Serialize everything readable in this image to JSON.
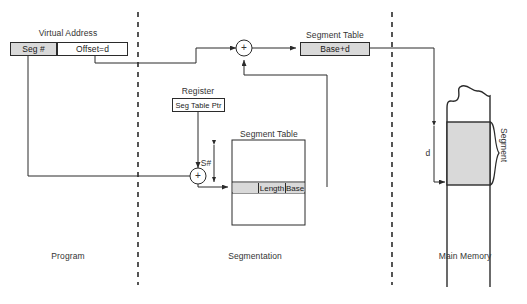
{
  "diagram": {
    "colors": {
      "line": "#2b2b2b",
      "shade": "#d9d9d9",
      "text": "#333333",
      "background": "#ffffff"
    },
    "program": {
      "virtual_address_label": "Virtual Address",
      "fields": [
        {
          "label": "Seg #",
          "shaded": true
        },
        {
          "label": "Offset=d",
          "shaded": false
        }
      ],
      "zone_label": "Program"
    },
    "segmentation": {
      "zone_label": "Segmentation",
      "register_label": "Register",
      "register_value": "Seg Table Ptr",
      "adder_symbol": "+",
      "s_number_label": "S#",
      "segment_table_label": "Segment Table",
      "entry_cells": [
        {
          "label": "",
          "shaded": true
        },
        {
          "label": "Length",
          "shaded": true
        },
        {
          "label": "Base",
          "shaded": true
        }
      ]
    },
    "result": {
      "segment_table_label": "Segment Table",
      "base_plus_d": "Base+d",
      "adder_symbol": "+"
    },
    "main_memory": {
      "zone_label": "Main Memory",
      "offset_label": "d",
      "segment_label": "Segment"
    }
  }
}
